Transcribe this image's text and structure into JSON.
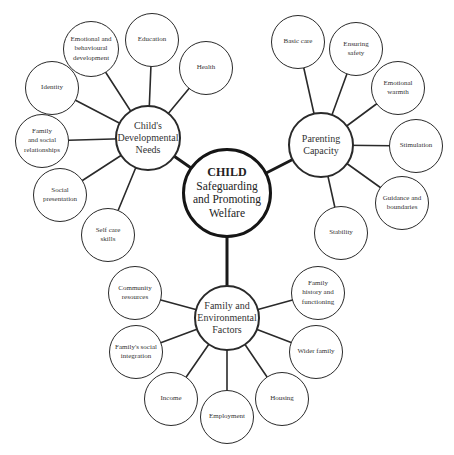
{
  "diagram": {
    "colors": {
      "line": "#2a2a2a",
      "text": "#333333",
      "background": "#ffffff"
    },
    "core": {
      "title": "CHILD",
      "subtitle": "Safeguarding\nand Promoting\nWelfare"
    },
    "hubs": {
      "developmental": {
        "label": "Child's\nDevelopmental\nNeeds"
      },
      "parenting": {
        "label": "Parenting\nCapacity"
      },
      "family": {
        "label": "Family and\nEnvironmental\nFactors"
      }
    },
    "developmental_items": [
      {
        "label": "Emotional and\nbehavioural\ndevelopment"
      },
      {
        "label": "Education"
      },
      {
        "label": "Health"
      },
      {
        "label": "Identity"
      },
      {
        "label": "Family\nand social\nrelationships"
      },
      {
        "label": "Social\npresentation"
      },
      {
        "label": "Self care\nskills"
      }
    ],
    "parenting_items": [
      {
        "label": "Basic care"
      },
      {
        "label": "Ensuring\nsafety"
      },
      {
        "label": "Emotional\nwarmth"
      },
      {
        "label": "Stimulation"
      },
      {
        "label": "Guidance and\nboundaries"
      },
      {
        "label": "Stability"
      }
    ],
    "family_items": [
      {
        "label": "Community\nresources"
      },
      {
        "label": "Family\nhistory and\nfunctioning"
      },
      {
        "label": "Family's social\nintegration"
      },
      {
        "label": "Wider family"
      },
      {
        "label": "Income"
      },
      {
        "label": "Employment"
      },
      {
        "label": "Housing"
      }
    ]
  }
}
